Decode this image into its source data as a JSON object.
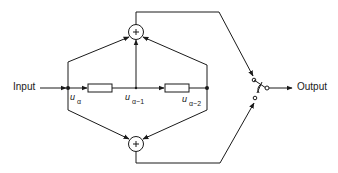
{
  "diagram": {
    "type": "signal-flow block diagram",
    "colors": {
      "line": "#1a1a1a",
      "background": "#ffffff"
    },
    "labels": {
      "input": "Input",
      "output": "Output"
    },
    "nodes": [
      {
        "id": "u_alpha",
        "symbol": "u",
        "subscript": "α"
      },
      {
        "id": "u_alpha_minus_1",
        "symbol": "u",
        "subscript": "α−1"
      },
      {
        "id": "u_alpha_minus_2",
        "symbol": "u",
        "subscript": "α−2"
      }
    ],
    "adders": [
      {
        "id": "top-adder",
        "symbol": "+"
      },
      {
        "id": "bottom-adder",
        "symbol": "+"
      }
    ],
    "delay_blocks": [
      {
        "id": "delay-1"
      },
      {
        "id": "delay-2"
      }
    ],
    "switch": {
      "id": "output-switch",
      "positions": 2
    }
  }
}
